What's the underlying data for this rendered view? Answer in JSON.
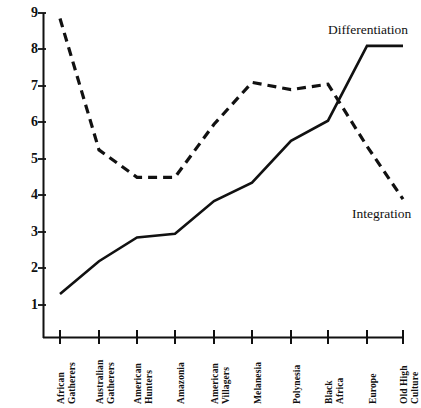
{
  "chart_data": {
    "type": "line",
    "title": "",
    "subtitle": "",
    "xlabel": "",
    "ylabel": "",
    "grid": false,
    "legend_position": "inline-right",
    "categories": [
      "African Gatherers",
      "Australian Gatherers",
      "American Hunters",
      "Amazonia",
      "American Villagers",
      "Melanesia",
      "Polynesia",
      "Black Africa",
      "Europe",
      "Old High Culture"
    ],
    "category_lines": [
      [
        "African",
        "Gatherers"
      ],
      [
        "Australian",
        "Gatherers"
      ],
      [
        "American",
        "Hunters"
      ],
      [
        "Amazonia"
      ],
      [
        "American",
        "Villagers"
      ],
      [
        "Melanesia"
      ],
      [
        "Polynesia"
      ],
      [
        "Black",
        "Africa"
      ],
      [
        "Europe"
      ],
      [
        "Old High",
        "Culture"
      ]
    ],
    "yticks": [
      1,
      2,
      3,
      4,
      5,
      6,
      7,
      8,
      9
    ],
    "ylim": [
      0.5,
      9.0
    ],
    "series": [
      {
        "name": "Differentiation",
        "style": "dashed",
        "color": "#111111",
        "values": [
          8.85,
          5.25,
          4.5,
          4.5,
          5.95,
          7.1,
          6.9,
          7.05,
          5.35,
          3.9
        ]
      },
      {
        "name": "Integration",
        "style": "solid",
        "color": "#111111",
        "values": [
          1.3,
          2.2,
          2.85,
          2.95,
          3.85,
          4.35,
          5.5,
          6.05,
          8.1,
          8.1
        ]
      }
    ]
  }
}
